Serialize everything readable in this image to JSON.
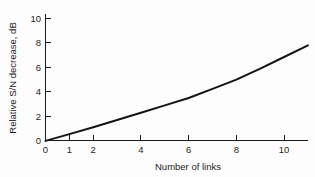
{
  "chart_data": {
    "type": "line",
    "title": "",
    "subtitle": "",
    "xlabel": "Number of links",
    "ylabel": "Relative S/N decrease, dB",
    "xlim": [
      0,
      11
    ],
    "ylim": [
      0,
      10.6
    ],
    "grid": false,
    "legend": null,
    "legend_position": "none",
    "x_ticks": [
      0,
      1,
      2,
      4,
      6,
      8,
      10
    ],
    "x_tick_labels": [
      "0",
      "1",
      "2",
      "4",
      "6",
      "8",
      "10"
    ],
    "y_ticks": [
      0,
      2,
      4,
      6,
      8,
      10
    ],
    "y_tick_labels": [
      "0",
      "2",
      "4",
      "6",
      "8",
      "10"
    ],
    "series": [
      {
        "name": "Relative S/N decrease",
        "color": "#141414",
        "x": [
          0,
          1,
          2,
          3,
          4,
          5,
          6,
          7,
          8,
          9,
          10,
          11
        ],
        "y": [
          0.0,
          0.55,
          1.12,
          1.7,
          2.3,
          2.9,
          3.5,
          4.25,
          5.0,
          5.9,
          6.85,
          7.8
        ]
      }
    ],
    "annotations": []
  },
  "axes": {
    "x_axis_name": "Number of links",
    "y_axis_name": "Relative S/N decrease, dB"
  },
  "colors": {
    "background": "#fdfdfd",
    "axis": "#1a1a1a",
    "curve": "#141414",
    "text": "#1d1d1d"
  }
}
